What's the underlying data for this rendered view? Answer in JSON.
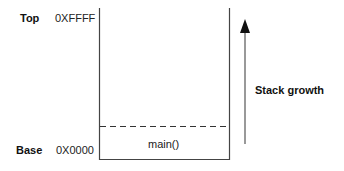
{
  "diagram": {
    "top": {
      "label": "Top",
      "address": "0XFFFF"
    },
    "base": {
      "label": "Base",
      "address": "0X0000"
    },
    "frames": [
      {
        "label": "main()"
      }
    ],
    "growth": {
      "label": "Stack growth",
      "direction": "up"
    },
    "colors": {
      "line": "#333333",
      "arrow": "#111111"
    }
  }
}
